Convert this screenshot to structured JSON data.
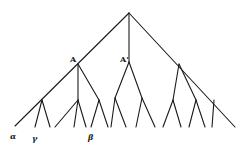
{
  "diagram": {
    "type": "tree",
    "labels": {
      "node_a": "A",
      "node_a_prime": "A'",
      "leaf_alpha": "α",
      "leaf_gamma": "γ",
      "leaf_beta": "β"
    },
    "colors": {
      "line": "#1a1a1a",
      "background": "#ffffff"
    }
  }
}
